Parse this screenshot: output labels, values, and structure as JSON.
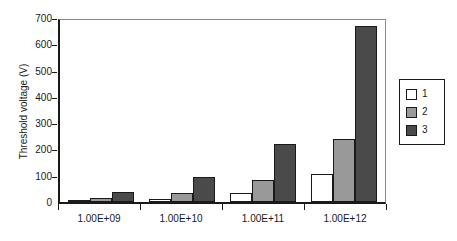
{
  "chart_data": {
    "type": "bar",
    "title": "",
    "subtitle": "",
    "xlabel": "",
    "ylabel": "Threshold voltage (V)",
    "categories": [
      "1.00E+09",
      "1.00E+10",
      "1.00E+11",
      "1.00E+12"
    ],
    "series": [
      {
        "name": "1",
        "color": "#ffffff",
        "values": [
          5,
          12,
          33,
          108
        ]
      },
      {
        "name": "2",
        "color": "#999999",
        "values": [
          15,
          35,
          85,
          240
        ]
      },
      {
        "name": "3",
        "color": "#4a4a4a",
        "values": [
          38,
          95,
          220,
          668
        ]
      }
    ],
    "ylim": [
      0,
      700
    ],
    "ytick_step": 100,
    "yticks": [
      0,
      100,
      200,
      300,
      400,
      500,
      600,
      700
    ],
    "ytick_labels": [
      "0",
      "100",
      "200",
      "300",
      "400",
      "500",
      "600",
      "700"
    ],
    "grid": false,
    "legend_position": "right",
    "bar_outline_color": "#1a1a1a",
    "plot_background": "#ffffff",
    "axis_color": "#1a1a1a"
  }
}
